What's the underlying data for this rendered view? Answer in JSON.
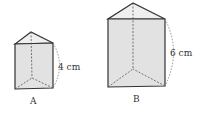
{
  "diagram": {
    "prisms": [
      {
        "id": "A",
        "label": "A",
        "height_label": "4 cm",
        "apex": [
          31,
          32
        ],
        "top_left": [
          15,
          44
        ],
        "top_right": [
          53,
          43
        ],
        "bottom_left": [
          15,
          89
        ],
        "bottom_right": [
          53,
          88
        ],
        "back_bottom": [
          32,
          78
        ]
      },
      {
        "id": "B",
        "label": "B",
        "height_label": "6 cm",
        "apex": [
          133,
          3
        ],
        "top_left": [
          108,
          19
        ],
        "top_right": [
          165,
          19
        ],
        "bottom_left": [
          108,
          87
        ],
        "bottom_right": [
          165,
          86
        ],
        "back_bottom": [
          133,
          69
        ]
      }
    ],
    "colors": {
      "edge": "#333333",
      "face": "#e4e4e4",
      "top_face": "#eeeeee",
      "hidden_edge": "#555555",
      "dimension_arc": "#777777"
    }
  }
}
